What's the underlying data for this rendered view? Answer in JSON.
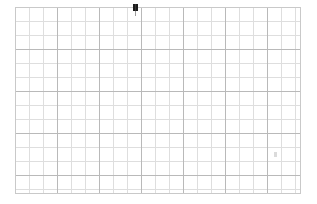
{
  "app": {
    "title": "Grid Canvas",
    "background_color": "#ffffff"
  },
  "canvas": {
    "name": "grid-sheet",
    "content_text": "",
    "origin_x": 15,
    "origin_y": 7,
    "width": 286,
    "height": 187,
    "grid": {
      "minor_spacing_px": 14,
      "major_spacing_px": 42,
      "minor_color": "#dedede",
      "major_color": "#b9b9b9",
      "border_color": "#c9c9c9",
      "columns": 20,
      "rows": 13
    }
  },
  "cursor": {
    "name": "text-caret",
    "x": 135,
    "y": 7,
    "color": "#1c1c1c",
    "label": ""
  },
  "marks": [
    {
      "name": "stray-mark",
      "x": 274,
      "y": 152,
      "color": "#d2d2d2",
      "label": ""
    }
  ]
}
